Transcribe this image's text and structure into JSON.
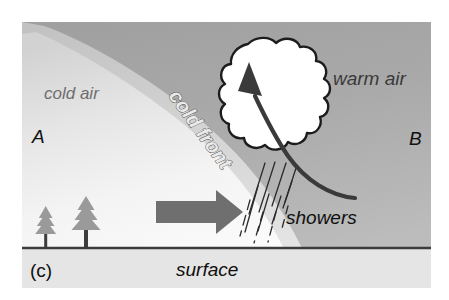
{
  "figure": {
    "panel_label": "(c)",
    "caption_label": "surface",
    "kind": "cold-front-cross-section"
  },
  "labels": {
    "cold_air": "cold air",
    "warm_air": "warm air",
    "cold_front": "cold front",
    "showers": "showers",
    "point_a": "A",
    "point_b": "B",
    "surface": "surface",
    "panel": "(c)"
  },
  "colors": {
    "page_background": "#ffffff",
    "warm_air_fill": "#a8a8a8",
    "warm_air_fill_dark": "#9a9a9a",
    "cold_air_fill_top": "#d8d8d8",
    "cold_air_fill_bottom": "#fafafa",
    "front_band": "#c9c9c9",
    "ground_band": "#e3e3e3",
    "cloud_fill": "#ffffff",
    "cloud_outline": "#1c1c1c",
    "flow_arrow": "#6b6b6b",
    "updraft_arrow": "#3a3a3a",
    "tree_foliage": "#9a9a9a",
    "tree_trunk": "#3d3d3d",
    "rain_streak": "#2f2f2f",
    "surface_line": "#3a3a3a",
    "cold_air_text": "#6e6e6e",
    "warm_air_text": "#3a3a3a",
    "black_text": "#111111"
  },
  "elements": {
    "cloud_name": "cumulonimbus-cloud",
    "updraft_name": "updraft-arrow",
    "flow_name": "cold-air-advance-arrow",
    "rain_name": "rain-shower-streaks",
    "trees_name": "conifer-trees",
    "ground_name": "surface-line"
  },
  "geometry": {
    "panel_left": 22,
    "panel_top": 22,
    "panel_right": 431,
    "panel_bottom": 288,
    "surface_y": 248
  }
}
